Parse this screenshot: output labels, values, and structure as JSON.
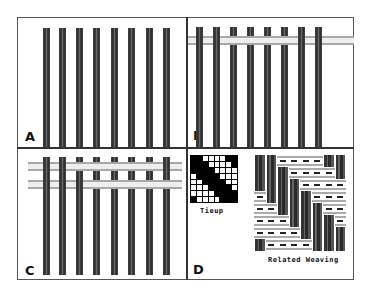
{
  "figure": {
    "panels": [
      {
        "id": "A",
        "label": "A",
        "description": "Eight vertical warp threads",
        "warp_count": 8,
        "weft_count": 0
      },
      {
        "id": "B",
        "label": "B",
        "description": "Warp threads with one weft pick inserted",
        "warp_count": 8,
        "weft_count": 1
      },
      {
        "id": "C",
        "label": "C",
        "description": "Warp threads with two weft picks inserted",
        "warp_count": 8,
        "weft_count": 2
      },
      {
        "id": "D",
        "label": "D",
        "description": "Tieup draft and resulting weave"
      }
    ],
    "tieup_caption": "Tieup",
    "weaving_caption": "Related Weaving",
    "tieup_grid": [
      [
        1,
        1,
        0,
        0,
        0,
        0,
        1,
        1
      ],
      [
        1,
        1,
        1,
        0,
        0,
        0,
        0,
        1
      ],
      [
        1,
        1,
        1,
        1,
        0,
        0,
        0,
        0
      ],
      [
        0,
        1,
        1,
        1,
        1,
        0,
        0,
        0
      ],
      [
        0,
        0,
        1,
        1,
        1,
        1,
        0,
        0
      ],
      [
        0,
        0,
        0,
        1,
        1,
        1,
        1,
        0
      ],
      [
        0,
        0,
        0,
        0,
        1,
        1,
        1,
        1
      ],
      [
        1,
        0,
        0,
        0,
        0,
        1,
        1,
        1
      ]
    ],
    "colors": {
      "frame": "#555555",
      "divider": "#333333",
      "warp": "#333333",
      "weft": "#aaaaaa",
      "background": "#ffffff"
    }
  }
}
